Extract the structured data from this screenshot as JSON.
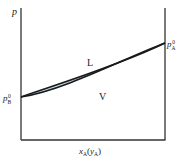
{
  "diagram": {
    "type": "pressure-composition phase diagram",
    "y_axis_label": "p",
    "x_axis_label": {
      "main": "x",
      "main_sub": "A",
      "paren_open": "(",
      "alt": "y",
      "alt_sub": "A",
      "paren_close": ")"
    },
    "left_point_label": {
      "base": "p",
      "sub": "B",
      "sup": "0"
    },
    "right_point_label": {
      "base": "p",
      "sub": "A",
      "sup": "0"
    },
    "region_upper": "L",
    "region_lower": "V",
    "colors": {
      "fill": "#c2e2f0",
      "line": "#1a1a1a",
      "axis": "#333333"
    }
  }
}
